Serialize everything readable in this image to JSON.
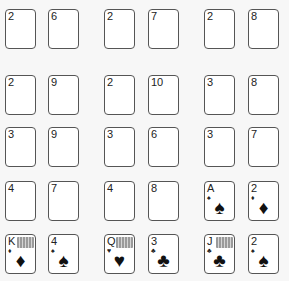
{
  "layout": {
    "columns_x": [
      5,
      48,
      104,
      148,
      204,
      248
    ],
    "rows_y": [
      9,
      75,
      127,
      181,
      234
    ]
  },
  "cards": [
    {
      "row": 0,
      "col": 0,
      "rank": "2",
      "face_up": false
    },
    {
      "row": 0,
      "col": 1,
      "rank": "6",
      "face_up": false
    },
    {
      "row": 0,
      "col": 2,
      "rank": "2",
      "face_up": false
    },
    {
      "row": 0,
      "col": 3,
      "rank": "7",
      "face_up": false
    },
    {
      "row": 0,
      "col": 4,
      "rank": "2",
      "face_up": false
    },
    {
      "row": 0,
      "col": 5,
      "rank": "8",
      "face_up": false
    },
    {
      "row": 1,
      "col": 0,
      "rank": "2",
      "face_up": false
    },
    {
      "row": 1,
      "col": 1,
      "rank": "9",
      "face_up": false
    },
    {
      "row": 1,
      "col": 2,
      "rank": "2",
      "face_up": false
    },
    {
      "row": 1,
      "col": 3,
      "rank": "10",
      "face_up": false
    },
    {
      "row": 1,
      "col": 4,
      "rank": "3",
      "face_up": false
    },
    {
      "row": 1,
      "col": 5,
      "rank": "8",
      "face_up": false
    },
    {
      "row": 2,
      "col": 0,
      "rank": "3",
      "face_up": false
    },
    {
      "row": 2,
      "col": 1,
      "rank": "9",
      "face_up": false
    },
    {
      "row": 2,
      "col": 2,
      "rank": "3",
      "face_up": false
    },
    {
      "row": 2,
      "col": 3,
      "rank": "6",
      "face_up": false
    },
    {
      "row": 2,
      "col": 4,
      "rank": "3",
      "face_up": false
    },
    {
      "row": 2,
      "col": 5,
      "rank": "7",
      "face_up": false
    },
    {
      "row": 3,
      "col": 0,
      "rank": "4",
      "face_up": false
    },
    {
      "row": 3,
      "col": 1,
      "rank": "7",
      "face_up": false
    },
    {
      "row": 3,
      "col": 2,
      "rank": "4",
      "face_up": false
    },
    {
      "row": 3,
      "col": 3,
      "rank": "8",
      "face_up": false
    },
    {
      "row": 3,
      "col": 4,
      "rank": "A",
      "suit": "spades",
      "suit_glyph": "♠",
      "face_up": true,
      "face_card": false
    },
    {
      "row": 3,
      "col": 5,
      "rank": "2",
      "suit": "diamonds",
      "suit_glyph": "♦",
      "face_up": true,
      "face_card": false
    },
    {
      "row": 4,
      "col": 0,
      "rank": "K",
      "suit": "diamonds",
      "suit_glyph": "♦",
      "face_up": true,
      "face_card": true
    },
    {
      "row": 4,
      "col": 1,
      "rank": "4",
      "suit": "spades",
      "suit_glyph": "♠",
      "face_up": true,
      "face_card": false
    },
    {
      "row": 4,
      "col": 2,
      "rank": "Q",
      "suit": "hearts",
      "suit_glyph": "♥",
      "face_up": true,
      "face_card": true
    },
    {
      "row": 4,
      "col": 3,
      "rank": "3",
      "suit": "clubs",
      "suit_glyph": "♣",
      "face_up": true,
      "face_card": false
    },
    {
      "row": 4,
      "col": 4,
      "rank": "J",
      "suit": "clubs",
      "suit_glyph": "♣",
      "face_up": true,
      "face_card": true
    },
    {
      "row": 4,
      "col": 5,
      "rank": "2",
      "suit": "spades",
      "suit_glyph": "♠",
      "face_up": true,
      "face_card": false
    }
  ]
}
